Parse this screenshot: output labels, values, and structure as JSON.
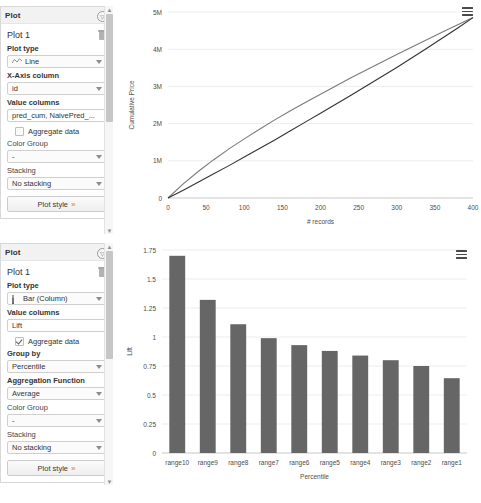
{
  "panels": [
    {
      "header_title": "Plot",
      "collapse_icon": "collapse-icon",
      "plot_name": "Plot 1",
      "delete_icon": "trash-icon",
      "fields": {
        "plot_type_label": "Plot type",
        "plot_type_value": "Line",
        "plot_type_icon": "line-chart-icon",
        "x_axis_label": "X-Axis column",
        "x_axis_value": "id",
        "value_columns_label": "Value columns",
        "value_columns_value": "pred_cum, NaivePred_...",
        "aggregate_label": "Aggregate data",
        "aggregate_checked": false,
        "color_group_label": "Color Group",
        "color_group_value": "-",
        "stacking_label": "Stacking",
        "stacking_value": "No stacking",
        "plot_style_label": "Plot style",
        "plot_style_chevron": "»"
      }
    },
    {
      "header_title": "Plot",
      "collapse_icon": "collapse-icon",
      "plot_name": "Plot 1",
      "delete_icon": "trash-icon",
      "fields": {
        "plot_type_label": "Plot type",
        "plot_type_value": "Bar (Column)",
        "plot_type_icon": "bar-chart-icon",
        "value_columns_label": "Value columns",
        "value_columns_value": "Lift",
        "aggregate_label": "Aggregate data",
        "aggregate_checked": true,
        "group_by_label": "Group by",
        "group_by_value": "Percentile",
        "agg_function_label": "Aggregation Function",
        "agg_function_value": "Average",
        "color_group_label": "Color Group",
        "color_group_value": "-",
        "stacking_label": "Stacking",
        "stacking_value": "No stacking",
        "plot_style_label": "Plot style",
        "plot_style_chevron": "»"
      }
    }
  ],
  "colors": {
    "bar_fill": "#666666",
    "line_model": "#7a7a7a",
    "line_naive": "#333333",
    "grid": "#ededed",
    "axis_text": "#4d4d4d"
  },
  "chart_data": [
    {
      "type": "line",
      "title": "",
      "xlabel": "# records",
      "ylabel": "Cumulative Price",
      "xlim": [
        0,
        400
      ],
      "ylim": [
        0,
        5000000
      ],
      "xticks": [
        0,
        50,
        100,
        150,
        200,
        250,
        300,
        350,
        400
      ],
      "xticklabels": [
        "0",
        "50",
        "100",
        "150",
        "200",
        "250",
        "300",
        "350",
        "400"
      ],
      "yticks": [
        0,
        1000000,
        2000000,
        3000000,
        4000000,
        5000000
      ],
      "yticklabels": [
        "0",
        "1M",
        "2M",
        "3M",
        "4M",
        "5M"
      ],
      "grid": true,
      "legend": "none",
      "menu_icon": "hamburger-menu-icon",
      "series": [
        {
          "name": "pred_cum",
          "color": "#7a7a7a",
          "x": [
            0,
            20,
            40,
            60,
            80,
            100,
            120,
            140,
            160,
            180,
            200,
            220,
            240,
            260,
            280,
            300,
            320,
            340,
            360,
            380,
            400
          ],
          "y": [
            0,
            380000,
            720000,
            1030000,
            1320000,
            1590000,
            1850000,
            2100000,
            2340000,
            2570000,
            2790000,
            3010000,
            3230000,
            3440000,
            3650000,
            3860000,
            4060000,
            4260000,
            4460000,
            4660000,
            4850000
          ]
        },
        {
          "name": "NaivePred_cum",
          "color": "#333333",
          "x": [
            0,
            20,
            40,
            60,
            80,
            100,
            120,
            140,
            160,
            180,
            200,
            220,
            240,
            260,
            280,
            300,
            320,
            340,
            360,
            380,
            400
          ],
          "y": [
            0,
            210000,
            430000,
            650000,
            870000,
            1100000,
            1330000,
            1560000,
            1800000,
            2040000,
            2280000,
            2520000,
            2760000,
            3010000,
            3260000,
            3510000,
            3770000,
            4030000,
            4300000,
            4570000,
            4850000
          ]
        }
      ]
    },
    {
      "type": "bar",
      "title": "",
      "xlabel": "Percentile",
      "ylabel": "Lift",
      "ylim": [
        0,
        1.75
      ],
      "yticks": [
        0,
        0.25,
        0.5,
        0.75,
        1,
        1.25,
        1.5,
        1.75
      ],
      "yticklabels": [
        "0",
        "0.25",
        "0.5",
        "0.75",
        "1",
        "1.25",
        "1.5",
        "1.75"
      ],
      "grid": true,
      "legend": "none",
      "menu_icon": "hamburger-menu-icon",
      "categories": [
        "range10",
        "range9",
        "range8",
        "range7",
        "range6",
        "range5",
        "range4",
        "range3",
        "range2",
        "range1"
      ],
      "values": [
        1.7,
        1.32,
        1.11,
        0.99,
        0.93,
        0.88,
        0.84,
        0.8,
        0.75,
        0.645
      ]
    }
  ]
}
